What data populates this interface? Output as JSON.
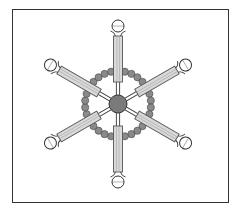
{
  "figure": {
    "caption_clipped": "",
    "center": {
      "x": 118,
      "y": 104,
      "hub_radius": 9,
      "hub_color": "#7a7a7a"
    },
    "arms": [
      {
        "id": "arm-top",
        "angle": -90
      },
      {
        "id": "arm-top-right",
        "angle": -30
      },
      {
        "id": "arm-bottom-right",
        "angle": 30
      },
      {
        "id": "arm-bottom",
        "angle": 90
      },
      {
        "id": "arm-bottom-left",
        "angle": 150
      },
      {
        "id": "arm-top-left",
        "angle": 210
      }
    ],
    "arm_geometry": {
      "linker_start": 9,
      "rod_start": 22,
      "rod_end": 68,
      "head_center": 78,
      "rod_width": 9
    },
    "bead_chains": {
      "ring_radius": 33,
      "beads_per_gap": 4,
      "bead_radius": 3.6,
      "bead_color": "#8a8a8a"
    },
    "colors": {
      "rod_fill": "#d9d9d9",
      "rod_stroke": "#555555",
      "head_fill": "#ffffff",
      "outline": "#333333"
    }
  }
}
